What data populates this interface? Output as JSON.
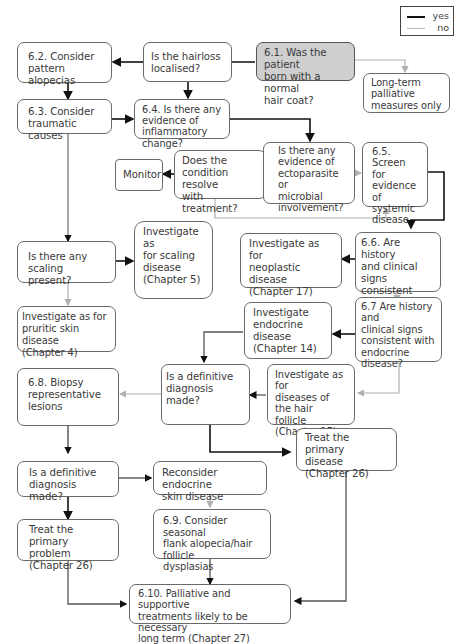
{
  "legend": {
    "yes": {
      "label": "yes",
      "color": "#111111"
    },
    "no": {
      "label": "no",
      "color": "#b8b8b8"
    }
  },
  "nodes": {
    "n61": [
      "6.1. Was the patient",
      "born with a normal",
      "hair coat?"
    ],
    "long_term": [
      "Long-term",
      "palliative",
      "measures only"
    ],
    "hairloss": [
      "Is the hairloss",
      "localised?"
    ],
    "n62": [
      "6.2. Consider",
      "pattern alopecias"
    ],
    "n63": [
      "6.3. Consider",
      "traumatic causes"
    ],
    "n64": [
      "6.4. Is there any",
      "evidence of",
      "inflammatory change?"
    ],
    "monitor": [
      "Monitor"
    ],
    "resolve": [
      "Does the",
      "condition resolve",
      "with treatment?"
    ],
    "ecto": [
      "Is there any",
      "evidence of",
      "ectoparasite or",
      "microbial",
      "involvement?"
    ],
    "n65": [
      "6.5.",
      "Screen for",
      "evidence",
      "of systemic",
      "disease"
    ],
    "scaling_q": [
      "Is there any scaling",
      "present?"
    ],
    "scaling_inv": [
      "Investigate as",
      "for scaling",
      "disease",
      "(Chapter 5)"
    ],
    "neoplastic": [
      "Investigate as for",
      "neoplastic disease",
      "(Chapter 17)"
    ],
    "n66": [
      "6.6. Are history",
      "and clinical signs",
      "consistent with",
      "neoplasia?"
    ],
    "pruritic": [
      "Investigate as for",
      "pruritic skin disease",
      "(Chapter 4)"
    ],
    "endocrine_inv": [
      "Investigate",
      "endocrine disease",
      "(Chapter 14)"
    ],
    "n67": [
      "6.7 Are history and",
      "clinical signs",
      "consistent with",
      "endocrine",
      "disease?"
    ],
    "n68": [
      "6.8. Biopsy",
      "representative lesions"
    ],
    "definitive1": [
      "Is a definitive",
      "diagnosis made?"
    ],
    "follicle_inv": [
      "Investigate as for",
      "diseases of the hair",
      "follicle",
      "(Chapter 15)"
    ],
    "treat_disease": [
      "Treat the primary",
      "disease",
      "(Chapter 26)"
    ],
    "definitive2": [
      "Is a definitive",
      "diagnosis made?"
    ],
    "reconsider": [
      "Reconsider endocrine",
      "skin disease"
    ],
    "treat_problem": [
      "Treat the primary",
      "problem",
      "(Chapter 26)"
    ],
    "n69": [
      "6.9. Consider seasonal",
      "flank alopecia/hair follicle",
      "dysplasias"
    ],
    "n610": [
      "6.10. Palliative and supportive",
      "treatments likely to be necessary",
      "long term (Chapter 27)"
    ]
  }
}
